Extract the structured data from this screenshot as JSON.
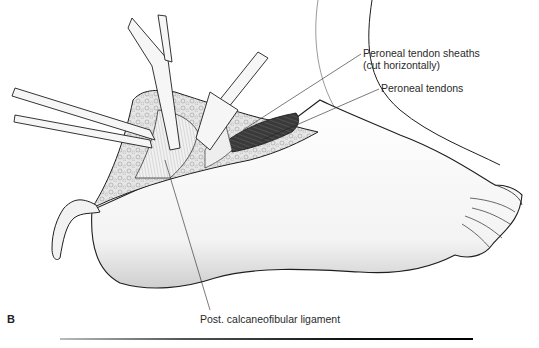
{
  "figure": {
    "panel_letter": "B",
    "labels": {
      "sheaths_line1": "Peroneal tendon sheaths",
      "sheaths_line2": "(cut horizontally)",
      "tendons": "Peroneal tendons",
      "ligament": "Post. calcaneofibular ligament"
    },
    "colors": {
      "ink": "#1e1e1e",
      "skin_shade": "#e9e9e9",
      "fat": "#d8d8d8",
      "cavity": "#2d2d2d",
      "instrument": "#f4f4f4"
    }
  }
}
